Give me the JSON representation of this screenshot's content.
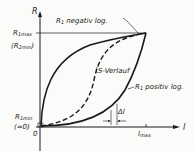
{
  "diagram": {
    "axes": {
      "y_label": "R",
      "x_label": "l",
      "x_tick_label": "l",
      "x_tick_sub": "max"
    },
    "y_labels": {
      "top_main": "R",
      "top_sub": "1max",
      "top_alt_open": "(R",
      "top_alt_sub": "2min",
      "top_alt_close": ")",
      "bottom_main": "R",
      "bottom_sub": "1min",
      "bottom_alt": "(≈0)",
      "origin": "0"
    },
    "curves": [
      {
        "name": "R",
        "sub": "1",
        "suffix": " negativ log.",
        "style": "solid"
      },
      {
        "name": "S-Verlauf",
        "style": "dashed"
      },
      {
        "name": "R",
        "sub": "1",
        "suffix": " positiv log.",
        "style": "solid"
      }
    ],
    "annotation": {
      "delta_label": "Δl"
    },
    "colors": {
      "ink": "#1a1a1a",
      "background": "#fbfbf9"
    }
  }
}
